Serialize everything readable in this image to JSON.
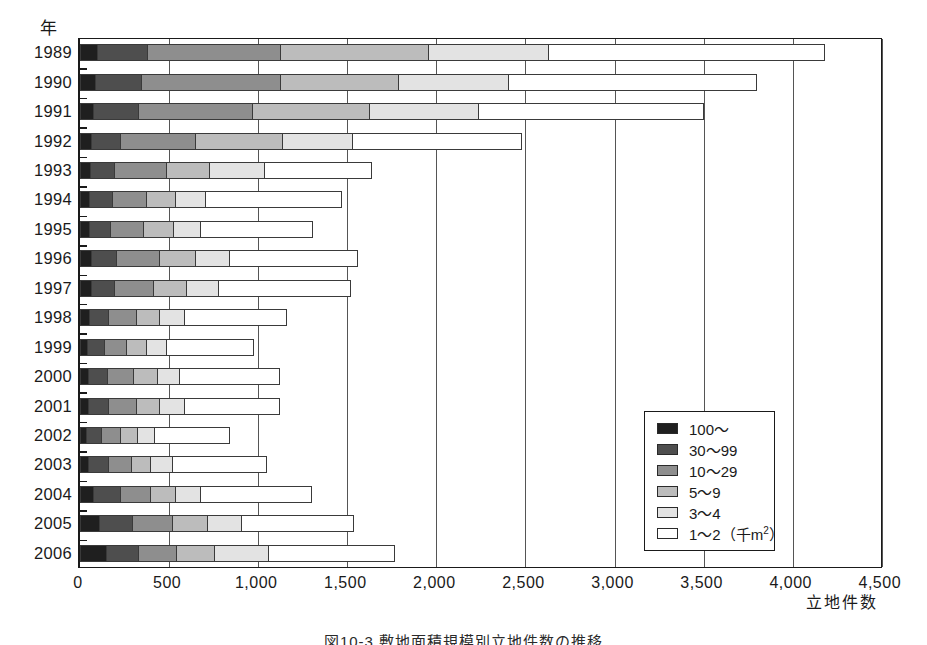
{
  "axes": {
    "y_axis_title": "年",
    "x_axis_title": "立地件数",
    "x_ticks": [
      "0",
      "500",
      "1,000",
      "1,500",
      "2,000",
      "2,500",
      "3,000",
      "3,500",
      "4,000",
      "4,500"
    ]
  },
  "legend": {
    "items": [
      {
        "label": "100〜",
        "swatch": "#1f1f1f"
      },
      {
        "label": "30〜99",
        "swatch": "#4e4e4e"
      },
      {
        "label": "10〜29",
        "swatch": "#8e8e8e"
      },
      {
        "label": "5〜9",
        "swatch": "#bcbcbc"
      },
      {
        "label": "3〜4",
        "swatch": "#e3e3e3"
      },
      {
        "label": "1〜2（千m²）",
        "swatch": "#ffffff"
      }
    ]
  },
  "caption": "図10-3 敷地面積規模別立地件数の推移",
  "chart_data": {
    "type": "bar",
    "orientation": "horizontal",
    "stacked": true,
    "title": "",
    "xlabel": "立地件数",
    "ylabel": "年",
    "xlim": [
      0,
      4500
    ],
    "xticks": [
      0,
      500,
      1000,
      1500,
      2000,
      2500,
      3000,
      3500,
      4000,
      4500
    ],
    "grid": true,
    "legend_position": "inside-right",
    "categories": [
      "1989",
      "1990",
      "1991",
      "1992",
      "1993",
      "1994",
      "1995",
      "1996",
      "1997",
      "1998",
      "1999",
      "2000",
      "2001",
      "2002",
      "2003",
      "2004",
      "2005",
      "2006"
    ],
    "series": [
      {
        "name": "100〜",
        "values": [
          100,
          90,
          80,
          65,
          60,
          55,
          55,
          70,
          65,
          55,
          45,
          50,
          50,
          40,
          50,
          80,
          110,
          150
        ]
      },
      {
        "name": "30〜99",
        "values": [
          380,
          350,
          330,
          230,
          195,
          185,
          175,
          210,
          195,
          165,
          140,
          155,
          165,
          125,
          160,
          230,
          300,
          330
        ]
      },
      {
        "name": "10〜29",
        "values": [
          1130,
          1130,
          970,
          650,
          490,
          375,
          360,
          450,
          415,
          320,
          265,
          305,
          320,
          230,
          290,
          400,
          520,
          545
        ]
      },
      {
        "name": "5〜9",
        "values": [
          1960,
          1790,
          1630,
          1140,
          730,
          540,
          525,
          650,
          600,
          450,
          375,
          435,
          450,
          325,
          400,
          540,
          720,
          760
        ]
      },
      {
        "name": "3〜4",
        "values": [
          2630,
          2410,
          2240,
          1530,
          1040,
          705,
          680,
          840,
          780,
          590,
          490,
          560,
          590,
          420,
          520,
          680,
          910,
          1060
        ]
      },
      {
        "name": "1〜2（千m²）",
        "values": [
          4180,
          3800,
          3500,
          2480,
          1640,
          1470,
          1310,
          1560,
          1520,
          1160,
          975,
          1120,
          1120,
          840,
          1050,
          1300,
          1535,
          1770
        ]
      }
    ],
    "cumulative": true,
    "note": "series values are cumulative right-edge positions of each stacked segment"
  }
}
